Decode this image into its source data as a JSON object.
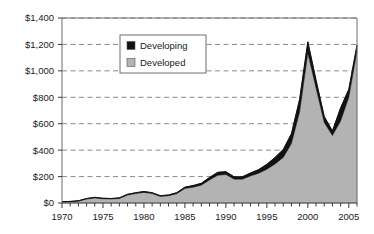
{
  "chart_data": {
    "type": "area",
    "stacked": true,
    "title": "",
    "subtitle": "",
    "xlabel": "",
    "ylabel": "",
    "xlim": [
      1970,
      2006
    ],
    "ylim": [
      0,
      1400
    ],
    "ytick_step": 200,
    "ytick_labels": [
      "$0",
      "$200",
      "$400",
      "$600",
      "$800",
      "$1,000",
      "$1,200",
      "$1,400"
    ],
    "ytick_values": [
      0,
      200,
      400,
      600,
      800,
      1000,
      1200,
      1400
    ],
    "xtick_labels": [
      "1970",
      "1975",
      "1980",
      "1985",
      "1990",
      "1995",
      "2000",
      "2005"
    ],
    "xtick_values": [
      1970,
      1975,
      1980,
      1985,
      1990,
      1995,
      2000,
      2005
    ],
    "xtick_minor_step": 1,
    "grid": "horizontal-dashed",
    "legend_position": "upper-center-left",
    "legend_boxed": true,
    "x": [
      1970,
      1971,
      1972,
      1973,
      1974,
      1975,
      1976,
      1977,
      1978,
      1979,
      1980,
      1981,
      1982,
      1983,
      1984,
      1985,
      1986,
      1987,
      1988,
      1989,
      1990,
      1991,
      1992,
      1993,
      1994,
      1995,
      1996,
      1997,
      1998,
      1999,
      2000,
      2001,
      2002,
      2003,
      2004,
      2005,
      2006
    ],
    "series": [
      {
        "name": "Developed",
        "color": "#b3b3b3",
        "values": [
          8,
          10,
          14,
          30,
          38,
          32,
          30,
          34,
          60,
          72,
          80,
          72,
          50,
          55,
          70,
          110,
          120,
          135,
          175,
          210,
          215,
          180,
          180,
          205,
          225,
          255,
          295,
          345,
          450,
          690,
          1135,
          870,
          610,
          510,
          620,
          800,
          1150
        ]
      },
      {
        "name": "Developing",
        "color": "#111111",
        "values": [
          2,
          2,
          3,
          4,
          5,
          4,
          4,
          5,
          6,
          6,
          7,
          6,
          5,
          6,
          8,
          10,
          12,
          14,
          18,
          22,
          22,
          18,
          18,
          22,
          28,
          38,
          50,
          60,
          75,
          95,
          85,
          60,
          45,
          35,
          100,
          60,
          45
        ]
      }
    ],
    "totals": [
      10,
      12,
      17,
      34,
      43,
      36,
      34,
      39,
      66,
      78,
      87,
      78,
      55,
      61,
      78,
      120,
      132,
      149,
      193,
      232,
      237,
      198,
      198,
      227,
      253,
      293,
      345,
      405,
      525,
      785,
      1220,
      930,
      655,
      545,
      720,
      860,
      1195
    ],
    "peak": {
      "year": 2000,
      "value": 1220
    },
    "trough": {
      "year": 2003,
      "value": 545
    },
    "end": {
      "year": 2006,
      "value": 1195
    }
  },
  "legend": {
    "items": [
      {
        "label": "Developing",
        "swatch": "black-square-icon"
      },
      {
        "label": "Developed",
        "swatch": "gray-square-icon"
      }
    ]
  }
}
